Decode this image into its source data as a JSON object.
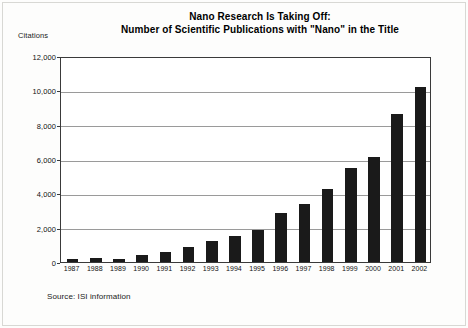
{
  "chart_data": {
    "type": "bar",
    "title": "Nano Research Is Taking Off:",
    "subtitle": "Number of Scientific Publications with \"Nano\" in the Title",
    "title_lines": [
      "Nano Research Is Taking Off:",
      "Number of Scientific Publications with \"Nano\" in the Title"
    ],
    "xlabel": "",
    "ylabel": "Citations",
    "categories": [
      "1987",
      "1988",
      "1989",
      "1990",
      "1991",
      "1992",
      "1993",
      "1994",
      "1995",
      "1996",
      "1997",
      "1998",
      "1999",
      "2000",
      "2001",
      "2002"
    ],
    "values": [
      200,
      250,
      200,
      400,
      600,
      900,
      1200,
      1500,
      1850,
      2850,
      3400,
      4250,
      5500,
      6100,
      8600,
      10200
    ],
    "ylim": [
      0,
      12000
    ],
    "ytick_values": [
      0,
      2000,
      4000,
      6000,
      8000,
      10000,
      12000
    ],
    "ytick_labels": [
      "0",
      "2,000",
      "4,000",
      "6,000",
      "8,000",
      "10,000",
      "12,000"
    ],
    "grid": true,
    "legend": false,
    "bar_color": "#1a1a1a",
    "source": "Source: ISI information"
  }
}
